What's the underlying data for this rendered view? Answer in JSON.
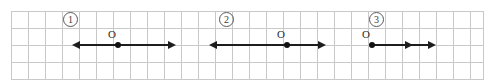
{
  "page": {
    "background_color": "#ffffff",
    "grid": {
      "line_color": "#c9c9c9",
      "cell_size_px": 17,
      "left_px": 11,
      "top_px": 11,
      "width_px": 472,
      "height_px": 68,
      "columns": 28,
      "rows": 4
    },
    "stroke_color": "#1d1d1d"
  },
  "diagrams": [
    {
      "index_label": "1",
      "origin_label": "O",
      "baseline_y_px": 45,
      "origin_x_px": 118,
      "badge_x_px": 63,
      "badge_y_px": 12,
      "origin_label_x_px": 108,
      "origin_label_y_px": 29,
      "rays": [
        {
          "direction": "left",
          "length_px": 38,
          "arrowhead": "left"
        },
        {
          "direction": "right",
          "length_px": 50,
          "arrowhead": "right"
        }
      ],
      "mid_arrow": false
    },
    {
      "index_label": "2",
      "origin_label": "O",
      "baseline_y_px": 45,
      "origin_x_px": 287,
      "badge_x_px": 219,
      "badge_y_px": 12,
      "origin_label_x_px": 277,
      "origin_label_y_px": 29,
      "rays": [
        {
          "direction": "left",
          "length_px": 70,
          "arrowhead": "left"
        },
        {
          "direction": "right",
          "length_px": 31,
          "arrowhead": "right"
        }
      ],
      "mid_arrow": false
    },
    {
      "index_label": "3",
      "origin_label": "O",
      "baseline_y_px": 45,
      "origin_x_px": 372,
      "badge_x_px": 369,
      "badge_y_px": 12,
      "origin_label_x_px": 362,
      "origin_label_y_px": 29,
      "rays": [
        {
          "direction": "right",
          "length_px": 56,
          "arrowhead": "right"
        }
      ],
      "mid_arrow": true,
      "mid_arrow_offset_px": 33
    }
  ]
}
